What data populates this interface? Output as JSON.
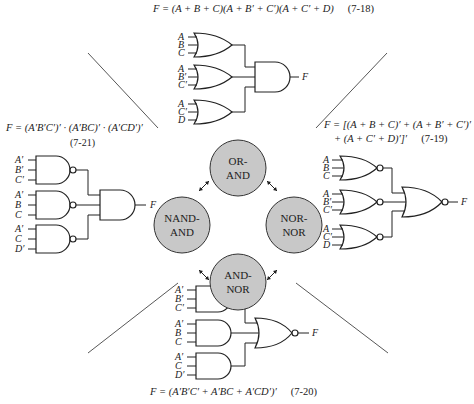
{
  "equations": {
    "or_and": {
      "text": "F = (A + B + C)(A + B′ + C′)(A + C′ + D)",
      "number": "(7-18)"
    },
    "nor_nor": {
      "line1": "F = [(A + B + C)′ + (A + B′ + C′)′",
      "line2": "+ (A + C′ + D)′]′",
      "number": "(7-19)"
    },
    "and_nor": {
      "text": "F = (A′B′C′ + A′BC + A′CD′)′",
      "number": "(7-20)"
    },
    "nand_and": {
      "text": "F = (A′B′C′)′ · (A′BC)′ · (A′CD′)′",
      "number": "(7-21)"
    }
  },
  "circuits": {
    "or_and": {
      "first_level": "OR",
      "second_level": "AND",
      "inputs": [
        [
          "A",
          "B",
          "C"
        ],
        [
          "A",
          "B′",
          "C′"
        ],
        [
          "A",
          "C′",
          "D"
        ]
      ],
      "output": "F"
    },
    "nor_nor": {
      "first_level": "NOR",
      "second_level": "NOR",
      "inputs": [
        [
          "A",
          "B",
          "C"
        ],
        [
          "A",
          "B′",
          "C′"
        ],
        [
          "A",
          "C′",
          "D"
        ]
      ],
      "output": "F"
    },
    "and_nor": {
      "first_level": "AND",
      "second_level": "NOR",
      "inputs": [
        [
          "A′",
          "B′",
          "C′"
        ],
        [
          "A′",
          "B",
          "C"
        ],
        [
          "A′",
          "C",
          "D′"
        ]
      ],
      "output": "F"
    },
    "nand_and": {
      "first_level": "NAND",
      "second_level": "AND",
      "inputs": [
        [
          "A′",
          "B′",
          "C′"
        ],
        [
          "A′",
          "B",
          "C"
        ],
        [
          "A′",
          "C",
          "D′"
        ]
      ],
      "output": "F"
    }
  },
  "hub": {
    "fill": "#c8c8c8",
    "nodes": [
      {
        "id": "or-and",
        "line1": "OR-",
        "line2": "AND"
      },
      {
        "id": "nand-and",
        "line1": "NAND-",
        "line2": "AND"
      },
      {
        "id": "nor-nor",
        "line1": "NOR-",
        "line2": "NOR"
      },
      {
        "id": "and-nor",
        "line1": "AND-",
        "line2": "NOR"
      }
    ]
  }
}
